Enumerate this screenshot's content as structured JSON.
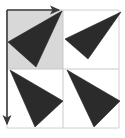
{
  "figure": {
    "type": "geometric-diagram",
    "canvas": {
      "width": 125,
      "height": 138,
      "background": "#ffffff"
    },
    "colors": {
      "triangle_fill": "#2b2b2b",
      "triangle_stroke": "#222222",
      "highlight_cell_fill": "#d8d8d8",
      "grid_line": "#c9c9c9",
      "outer_border": "#d0d0d0",
      "arrow": "#3a3a3a"
    },
    "grid": {
      "rows": 2,
      "columns": 2,
      "origin_x": 7,
      "origin_y": 10,
      "cell_width": 56,
      "cell_height": 59,
      "vertical_divider_x": 63,
      "horizontal_divider_y": 69,
      "right_edge_x": 119,
      "bottom_edge_y": 128,
      "show_grid": true
    },
    "highlight_cell": {
      "label": "fundamental-domain",
      "x": 7,
      "y": 10,
      "width": 56,
      "height": 59,
      "fill": "#d8d8d8"
    },
    "triangles": [
      {
        "name": "triangle-top-left",
        "cell": "top-left",
        "points": "62,11 8,42 36,67",
        "fill": "#2b2b2b"
      },
      {
        "name": "triangle-top-right",
        "cell": "top-right",
        "points": "121,12 65,39 88,59",
        "fill": "#2b2b2b"
      },
      {
        "name": "triangle-bottom-left",
        "cell": "bottom-left",
        "points": "10,70 63,101 35,127",
        "fill": "#2b2b2b"
      },
      {
        "name": "triangle-bottom-right",
        "cell": "bottom-right",
        "points": "67,70 120,101 94,127",
        "fill": "#2b2b2b"
      }
    ],
    "arrows": [
      {
        "name": "translation-vector-horizontal",
        "direction": "right",
        "from_x": 7,
        "from_y": 10,
        "to_x": 63,
        "to_y": 10,
        "color": "#3a3a3a"
      },
      {
        "name": "translation-vector-vertical",
        "direction": "down",
        "from_x": 7,
        "from_y": 10,
        "to_x": 7,
        "to_y": 128,
        "color": "#3a3a3a"
      }
    ]
  }
}
